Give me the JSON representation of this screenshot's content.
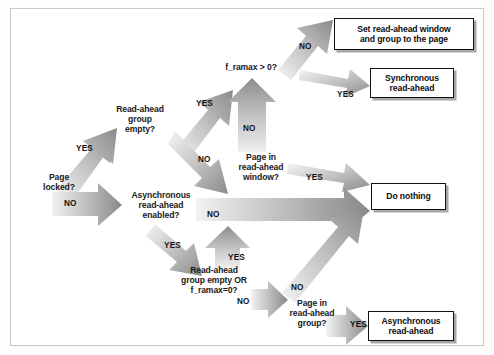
{
  "figure": {
    "frame_border_color": "#c9c9c9",
    "background_color": "#ffffff",
    "arrow_fill_light": "#f2f2f2",
    "arrow_fill_dark": "#8c8c8c",
    "box_border_color": "#111111",
    "text_color": "#1a1a1a"
  },
  "nodes": [
    {
      "id": "page_locked",
      "label": "Page\nlocked?",
      "x": 24,
      "y": 172,
      "w": 70,
      "type": "decision"
    },
    {
      "id": "ra_group_empty",
      "label": "Read-ahead\ngroup\nempty?",
      "x": 100,
      "y": 104,
      "w": 80,
      "type": "decision"
    },
    {
      "id": "framax_gt0",
      "label": "f_ramax > 0?",
      "x": 207,
      "y": 62,
      "w": 88,
      "type": "decision"
    },
    {
      "id": "page_in_ra_window",
      "label": "Page in\nread-ahead\nwindow?",
      "x": 222,
      "y": 152,
      "w": 78,
      "type": "decision"
    },
    {
      "id": "async_ra_enabled",
      "label": "Asynchronous\nread-ahead\nenabled?",
      "x": 118,
      "y": 190,
      "w": 86,
      "type": "decision"
    },
    {
      "id": "ra_group_empty_or",
      "label": "Read-ahead\ngroup empty OR\nf_ramax=0?",
      "x": 166,
      "y": 265,
      "w": 96,
      "type": "decision"
    },
    {
      "id": "page_in_ra_group",
      "label": "Page in\nread-ahead\ngroup?",
      "x": 276,
      "y": 298,
      "w": 72,
      "type": "decision"
    }
  ],
  "boxes": [
    {
      "id": "set_window_group",
      "label": "Set read-ahead window\nand group to the page",
      "x": 334,
      "y": 18,
      "w": 140,
      "h": 32
    },
    {
      "id": "sync_readahead",
      "label": "Synchronous\nread-ahead",
      "x": 370,
      "y": 68,
      "w": 84,
      "h": 30
    },
    {
      "id": "do_nothing",
      "label": "Do nothing",
      "x": 371,
      "y": 183,
      "w": 75,
      "h": 27
    },
    {
      "id": "async_readahead",
      "label": "Asynchronous\nread-ahead",
      "x": 368,
      "y": 311,
      "w": 86,
      "h": 30
    }
  ],
  "edges": [
    {
      "id": "e1",
      "from": "page_locked",
      "to": "ra_group_empty",
      "label": "YES"
    },
    {
      "id": "e2",
      "from": "page_locked",
      "to": "async_ra_enabled",
      "label": "NO"
    },
    {
      "id": "e3",
      "from": "ra_group_empty",
      "to": "framax_gt0",
      "label": "YES"
    },
    {
      "id": "e4",
      "from": "ra_group_empty",
      "to": "page_in_ra_window",
      "label": "NO"
    },
    {
      "id": "e5",
      "from": "framax_gt0",
      "to": "set_window_group",
      "label": "NO"
    },
    {
      "id": "e6",
      "from": "framax_gt0",
      "to": "sync_readahead",
      "label": "YES"
    },
    {
      "id": "e7",
      "from": "page_in_ra_window",
      "to": "framax_gt0",
      "label": "NO"
    },
    {
      "id": "e8",
      "from": "page_in_ra_window",
      "to": "do_nothing",
      "label": "YES"
    },
    {
      "id": "e9",
      "from": "async_ra_enabled",
      "to": "do_nothing",
      "label": "NO"
    },
    {
      "id": "e10",
      "from": "async_ra_enabled",
      "to": "ra_group_empty_or",
      "label": "YES"
    },
    {
      "id": "e11",
      "from": "ra_group_empty_or",
      "to": "page_in_ra_window",
      "label": "YES"
    },
    {
      "id": "e12",
      "from": "ra_group_empty_or",
      "to": "page_in_ra_group",
      "label": "NO"
    },
    {
      "id": "e13",
      "from": "page_in_ra_group",
      "to": "do_nothing",
      "label": "NO"
    },
    {
      "id": "e14",
      "from": "page_in_ra_group",
      "to": "async_readahead",
      "label": "YES"
    }
  ],
  "edge_labels": {
    "e1": {
      "text": "YES",
      "x": 76,
      "y": 144
    },
    "e2": {
      "text": "NO",
      "x": 64,
      "y": 199
    },
    "e3": {
      "text": "YES",
      "x": 196,
      "y": 99
    },
    "e4": {
      "text": "NO",
      "x": 198,
      "y": 155
    },
    "e5": {
      "text": "NO",
      "x": 299,
      "y": 42
    },
    "e6": {
      "text": "YES",
      "x": 337,
      "y": 90
    },
    "e7": {
      "text": "NO",
      "x": 243,
      "y": 124
    },
    "e8": {
      "text": "YES",
      "x": 306,
      "y": 173
    },
    "e9": {
      "text": "NO",
      "x": 207,
      "y": 210
    },
    "e10": {
      "text": "YES",
      "x": 164,
      "y": 241
    },
    "e11": {
      "text": "YES",
      "x": 228,
      "y": 253
    },
    "e12": {
      "text": "NO",
      "x": 237,
      "y": 297
    },
    "e13": {
      "text": "NO",
      "x": 291,
      "y": 283
    },
    "e14": {
      "text": "YES",
      "x": 350,
      "y": 320
    }
  }
}
